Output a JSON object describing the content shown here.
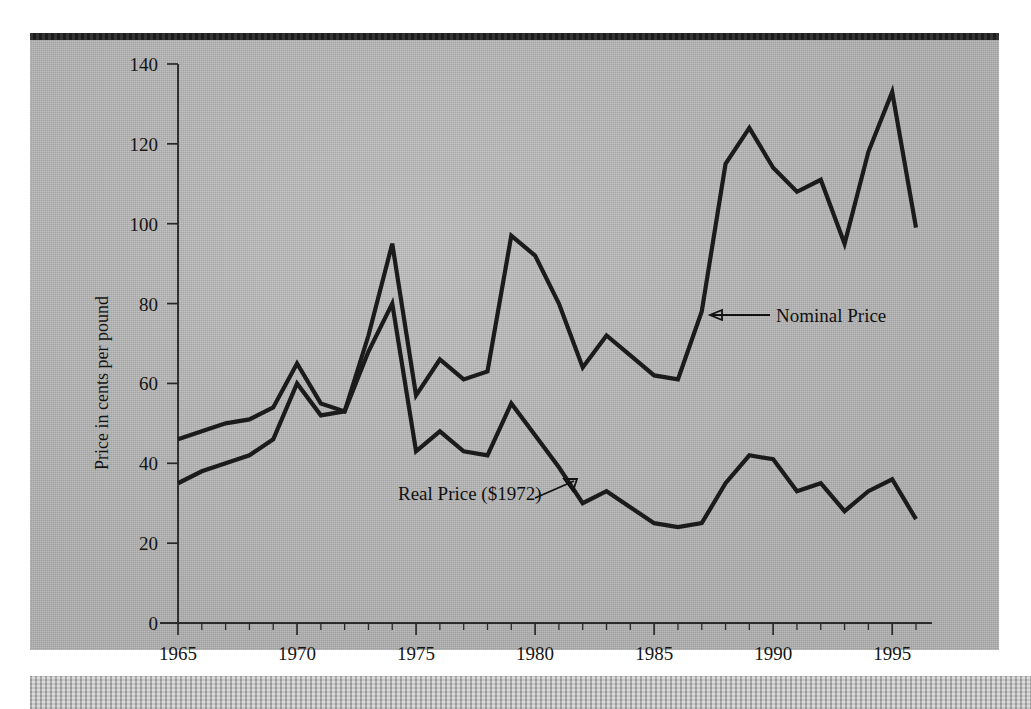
{
  "figure": {
    "y_axis_title": "Price in cents per pound",
    "annotations": [
      {
        "name": "nominal",
        "label": "Nominal Price"
      },
      {
        "name": "real",
        "label": "Real Price ($1972)"
      }
    ]
  },
  "chart_data": {
    "type": "line",
    "title": "",
    "xlabel": "",
    "ylabel": "Price in cents per pound",
    "xlim": [
      1965,
      1996
    ],
    "ylim": [
      0,
      140
    ],
    "yticks": [
      0,
      20,
      40,
      60,
      80,
      100,
      120,
      140
    ],
    "ytick_labels": [
      "0",
      "20",
      "40",
      "60",
      "80",
      "100",
      "120",
      "140"
    ],
    "xticks": [
      1965,
      1970,
      1975,
      1980,
      1985,
      1990,
      1995
    ],
    "xtick_labels": [
      "1965",
      "1970",
      "1975",
      "1980",
      "1985",
      "1990",
      "1995"
    ],
    "x_minor_tick_step": 1,
    "grid": false,
    "legend": "annotated-inline",
    "x": [
      1965,
      1966,
      1967,
      1968,
      1969,
      1970,
      1971,
      1972,
      1973,
      1974,
      1975,
      1976,
      1977,
      1978,
      1979,
      1980,
      1981,
      1982,
      1983,
      1984,
      1985,
      1986,
      1987,
      1988,
      1989,
      1990,
      1991,
      1992,
      1993,
      1994,
      1995,
      1996
    ],
    "series": [
      {
        "name": "Nominal Price",
        "values": [
          46,
          48,
          50,
          51,
          54,
          65,
          55,
          53,
          72,
          95,
          57,
          66,
          61,
          63,
          97,
          92,
          80,
          64,
          72,
          67,
          62,
          61,
          78,
          115,
          124,
          114,
          108,
          111,
          95,
          118,
          133,
          99
        ]
      },
      {
        "name": "Real Price ($1972)",
        "values": [
          35,
          38,
          40,
          42,
          46,
          60,
          52,
          53,
          68,
          80,
          43,
          48,
          43,
          42,
          55,
          47,
          39,
          30,
          33,
          29,
          25,
          24,
          25,
          35,
          42,
          41,
          33,
          35,
          28,
          33,
          36,
          26
        ]
      }
    ]
  }
}
